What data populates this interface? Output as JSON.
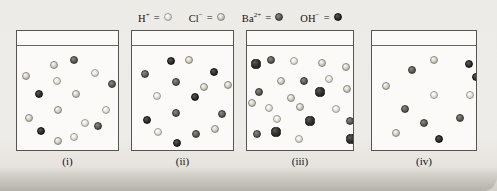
{
  "figure": {
    "background_color": "#eceae6"
  },
  "legend": {
    "entries": [
      {
        "name": "hydrogen-ion",
        "label": "H",
        "charge": "+",
        "equals": "=",
        "sphere_style": "s-light",
        "color": "#e9e7e2",
        "size": 8
      },
      {
        "name": "chloride-ion",
        "label": "Cl",
        "charge": "−",
        "equals": "=",
        "sphere_style": "s-lightgray",
        "color": "#c9c6bf",
        "size": 8
      },
      {
        "name": "barium-ion",
        "label": "Ba",
        "charge": "2+",
        "equals": "=",
        "sphere_style": "s-mid",
        "color": "#5b5751",
        "size": 8
      },
      {
        "name": "hydroxide-ion",
        "label": "OH",
        "charge": "−",
        "equals": "=",
        "sphere_style": "s-dark",
        "color": "#2c2a27",
        "size": 8
      }
    ]
  },
  "chart_data": {
    "type": "scatter",
    "xlabel": "",
    "ylabel": "",
    "legend_position": "top-center",
    "grid": false,
    "species": [
      "H+",
      "Cl-",
      "Ba2+",
      "OH-"
    ],
    "species_colors": {
      "H+": "#e9e7e2",
      "Cl-": "#c9c6bf",
      "Ba2+": "#5b5751",
      "OH-": "#2c2a27"
    },
    "panels": [
      {
        "label": "(i)",
        "counts": {
          "H+": 5,
          "Cl-": 6,
          "Ba2+": 3,
          "OH-": 2
        },
        "total": 16
      },
      {
        "label": "(ii)",
        "counts": {
          "H+": 2,
          "Cl-": 4,
          "Ba2+": 5,
          "OH-": 5
        },
        "total": 16
      },
      {
        "label": "(iii)",
        "counts": {
          "H+": 6,
          "Cl-": 7,
          "Ba2+": 5,
          "OH-": 5
        },
        "total": 23
      },
      {
        "label": "(iv)",
        "counts": {
          "H+": 2,
          "Cl-": 3,
          "Ba2+": 4,
          "OH-": 3
        },
        "total": 12
      }
    ]
  },
  "containers": [
    {
      "name": "container-i",
      "caption": "(i)",
      "x": 16,
      "y": 30,
      "width": 103,
      "height": 121,
      "rim_y": 14,
      "spheres": [
        {
          "cx": 37,
          "cy": 34,
          "r": 4.2,
          "style": "s-lightgray",
          "species": "Cl-"
        },
        {
          "cx": 57,
          "cy": 29,
          "r": 4.2,
          "style": "s-mid",
          "species": "Ba2+"
        },
        {
          "cx": 9,
          "cy": 45,
          "r": 4.2,
          "style": "s-lightgray",
          "species": "Cl-"
        },
        {
          "cx": 78,
          "cy": 42,
          "r": 4.2,
          "style": "s-light",
          "species": "H+"
        },
        {
          "cx": 40,
          "cy": 50,
          "r": 4.2,
          "style": "s-light",
          "species": "H+"
        },
        {
          "cx": 95,
          "cy": 53,
          "r": 4.2,
          "style": "s-mid",
          "species": "Ba2+"
        },
        {
          "cx": 22,
          "cy": 63,
          "r": 4.4,
          "style": "s-dark",
          "species": "OH-"
        },
        {
          "cx": 59,
          "cy": 63,
          "r": 4.2,
          "style": "s-lightgray",
          "species": "Cl-"
        },
        {
          "cx": 41,
          "cy": 79,
          "r": 4.2,
          "style": "s-lightgray",
          "species": "Cl-"
        },
        {
          "cx": 89,
          "cy": 79,
          "r": 4.2,
          "style": "s-light",
          "species": "H+"
        },
        {
          "cx": 12,
          "cy": 87,
          "r": 4.2,
          "style": "s-lightgray",
          "species": "Cl-"
        },
        {
          "cx": 68,
          "cy": 92,
          "r": 4.2,
          "style": "s-light",
          "species": "H+"
        },
        {
          "cx": 81,
          "cy": 95,
          "r": 4.4,
          "style": "s-mid",
          "species": "Ba2+"
        },
        {
          "cx": 24,
          "cy": 100,
          "r": 4.4,
          "style": "s-dark",
          "species": "OH-"
        },
        {
          "cx": 57,
          "cy": 106,
          "r": 4.2,
          "style": "s-light",
          "species": "H+"
        },
        {
          "cx": 41,
          "cy": 110,
          "r": 4.2,
          "style": "s-lightgray",
          "species": "Cl-"
        }
      ]
    },
    {
      "name": "container-ii",
      "caption": "(ii)",
      "x": 131,
      "y": 30,
      "width": 103,
      "height": 121,
      "rim_y": 14,
      "spheres": [
        {
          "cx": 39,
          "cy": 30,
          "r": 4.4,
          "style": "s-dark",
          "species": "OH-"
        },
        {
          "cx": 57,
          "cy": 29,
          "r": 4.2,
          "style": "s-lightgray",
          "species": "Cl-"
        },
        {
          "cx": 13,
          "cy": 43,
          "r": 4.4,
          "style": "s-mid",
          "species": "Ba2+"
        },
        {
          "cx": 82,
          "cy": 41,
          "r": 4.4,
          "style": "s-dark",
          "species": "OH-"
        },
        {
          "cx": 44,
          "cy": 51,
          "r": 4.4,
          "style": "s-mid",
          "species": "Ba2+"
        },
        {
          "cx": 96,
          "cy": 54,
          "r": 4.2,
          "style": "s-lightgray",
          "species": "Cl-"
        },
        {
          "cx": 25,
          "cy": 65,
          "r": 4.2,
          "style": "s-light",
          "species": "H+"
        },
        {
          "cx": 63,
          "cy": 66,
          "r": 4.4,
          "style": "s-dark",
          "species": "OH-"
        },
        {
          "cx": 44,
          "cy": 82,
          "r": 4.4,
          "style": "s-mid",
          "species": "Ba2+"
        },
        {
          "cx": 90,
          "cy": 83,
          "r": 4.4,
          "style": "s-mid",
          "species": "Ba2+"
        },
        {
          "cx": 15,
          "cy": 89,
          "r": 4.4,
          "style": "s-dark",
          "species": "OH-"
        },
        {
          "cx": 83,
          "cy": 98,
          "r": 4.2,
          "style": "s-lightgray",
          "species": "Cl-"
        },
        {
          "cx": 26,
          "cy": 101,
          "r": 4.2,
          "style": "s-light",
          "species": "H+"
        },
        {
          "cx": 64,
          "cy": 103,
          "r": 4.4,
          "style": "s-mid",
          "species": "Ba2+"
        },
        {
          "cx": 45,
          "cy": 112,
          "r": 4.4,
          "style": "s-dark",
          "species": "OH-"
        },
        {
          "cx": 72,
          "cy": 56,
          "r": 4.2,
          "style": "s-lightgray",
          "species": "Cl-"
        }
      ]
    },
    {
      "name": "container-iii",
      "caption": "(iii)",
      "x": 246,
      "y": 30,
      "width": 108,
      "height": 121,
      "rim_y": 14,
      "spheres": [
        {
          "cx": 9,
          "cy": 33,
          "r": 4.6,
          "style": "s-dark",
          "species": "OH-"
        },
        {
          "cx": 24,
          "cy": 29,
          "r": 4.4,
          "style": "s-mid",
          "species": "Ba2+"
        },
        {
          "cx": 47,
          "cy": 30,
          "r": 4.2,
          "style": "s-light",
          "species": "H+"
        },
        {
          "cx": 75,
          "cy": 32,
          "r": 4.2,
          "style": "s-lightgray",
          "species": "Cl-"
        },
        {
          "cx": 99,
          "cy": 36,
          "r": 4.2,
          "style": "s-lightgray",
          "species": "Cl-"
        },
        {
          "cx": 34,
          "cy": 50,
          "r": 4.2,
          "style": "s-lightgray",
          "species": "Cl-"
        },
        {
          "cx": 57,
          "cy": 50,
          "r": 4.4,
          "style": "s-mid",
          "species": "Ba2+"
        },
        {
          "cx": 82,
          "cy": 48,
          "r": 4.2,
          "style": "s-light",
          "species": "H+"
        },
        {
          "cx": 12,
          "cy": 61,
          "r": 4.4,
          "style": "s-mid",
          "species": "Ba2+"
        },
        {
          "cx": 73,
          "cy": 61,
          "r": 4.6,
          "style": "s-dark",
          "species": "OH-"
        },
        {
          "cx": 100,
          "cy": 58,
          "r": 4.2,
          "style": "s-lightgray",
          "species": "Cl-"
        },
        {
          "cx": 44,
          "cy": 67,
          "r": 4.2,
          "style": "s-lightgray",
          "species": "Cl-"
        },
        {
          "cx": 22,
          "cy": 77,
          "r": 4.2,
          "style": "s-light",
          "species": "H+"
        },
        {
          "cx": 53,
          "cy": 76,
          "r": 4.2,
          "style": "s-lightgray",
          "species": "Cl-"
        },
        {
          "cx": 89,
          "cy": 78,
          "r": 4.2,
          "style": "s-light",
          "species": "H+"
        },
        {
          "cx": 5,
          "cy": 72,
          "r": 4.2,
          "style": "s-lightgray",
          "species": "Cl-"
        },
        {
          "cx": 63,
          "cy": 90,
          "r": 4.6,
          "style": "s-dark",
          "species": "OH-"
        },
        {
          "cx": 103,
          "cy": 90,
          "r": 4.4,
          "style": "s-mid",
          "species": "Ba2+"
        },
        {
          "cx": 10,
          "cy": 103,
          "r": 4.4,
          "style": "s-mid",
          "species": "Ba2+"
        },
        {
          "cx": 29,
          "cy": 101,
          "r": 4.6,
          "style": "s-dark",
          "species": "OH-"
        },
        {
          "cx": 52,
          "cy": 108,
          "r": 4.2,
          "style": "s-light",
          "species": "H+"
        },
        {
          "cx": 104,
          "cy": 108,
          "r": 4.6,
          "style": "s-dark",
          "species": "OH-"
        },
        {
          "cx": 30,
          "cy": 88,
          "r": 4.2,
          "style": "s-light",
          "species": "H+"
        }
      ]
    },
    {
      "name": "container-iv",
      "caption": "(iv)",
      "x": 371,
      "y": 30,
      "width": 106,
      "height": 121,
      "rim_y": 14,
      "spheres": [
        {
          "cx": 62,
          "cy": 29,
          "r": 4.2,
          "style": "s-lightgray",
          "species": "Cl-"
        },
        {
          "cx": 97,
          "cy": 33,
          "r": 4.4,
          "style": "s-dark",
          "species": "OH-"
        },
        {
          "cx": 40,
          "cy": 39,
          "r": 4.4,
          "style": "s-mid",
          "species": "Ba2+"
        },
        {
          "cx": 14,
          "cy": 55,
          "r": 4.2,
          "style": "s-lightgray",
          "species": "Cl-"
        },
        {
          "cx": 62,
          "cy": 64,
          "r": 4.2,
          "style": "s-light",
          "species": "H+"
        },
        {
          "cx": 98,
          "cy": 64,
          "r": 4.2,
          "style": "s-light",
          "species": "H+"
        },
        {
          "cx": 33,
          "cy": 78,
          "r": 4.4,
          "style": "s-mid",
          "species": "Ba2+"
        },
        {
          "cx": 88,
          "cy": 87,
          "r": 4.4,
          "style": "s-mid",
          "species": "Ba2+"
        },
        {
          "cx": 24,
          "cy": 102,
          "r": 4.2,
          "style": "s-lightgray",
          "species": "Cl-"
        },
        {
          "cx": 67,
          "cy": 108,
          "r": 4.4,
          "style": "s-dark",
          "species": "OH-"
        },
        {
          "cx": 104,
          "cy": 46,
          "r": 4.4,
          "style": "s-dark",
          "species": "OH-"
        },
        {
          "cx": 52,
          "cy": 92,
          "r": 4.4,
          "style": "s-mid",
          "species": "Ba2+"
        }
      ]
    }
  ]
}
